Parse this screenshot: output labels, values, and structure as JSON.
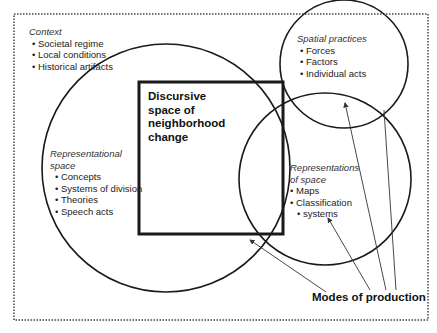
{
  "diagram": {
    "context": {
      "title": "Context",
      "items": [
        "Societal regime",
        "Local conditions",
        "Historical artifacts"
      ]
    },
    "spatial_practices": {
      "title": "Spatial practices",
      "items": [
        "Forces",
        "Factors",
        "Individual acts"
      ]
    },
    "representational_space": {
      "title_line1": "Representational",
      "title_line2": "space",
      "items": [
        "Concepts",
        "Systems of division",
        "Theories",
        "Speech acts"
      ]
    },
    "representations_of_space": {
      "title_line1": "Representations",
      "title_line2": "of space",
      "items": [
        "Maps",
        "Classification",
        "systems"
      ]
    },
    "discursive_space": {
      "lines": [
        "Discursive",
        "space of",
        "neighborhood",
        "change"
      ]
    },
    "modes_of_production": "Modes of production",
    "colors": {
      "stroke": "#1a1a1a",
      "border": "#333333",
      "background": "#ffffff"
    }
  }
}
